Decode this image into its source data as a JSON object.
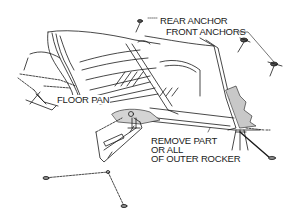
{
  "figure": {
    "type": "technical-illustration",
    "colors": {
      "line": "#1a1a1a",
      "shading": "#c8c8c8",
      "background": "#ffffff"
    }
  },
  "labels": {
    "rear_anchor": "REAR ANCHOR",
    "front_anchors": "FRONT ANCHORS",
    "floor_pan": "FLOOR PAN",
    "remove_line1": "REMOVE PART",
    "remove_line2": "OR ALL",
    "remove_line3": "OF OUTER ROCKER"
  }
}
